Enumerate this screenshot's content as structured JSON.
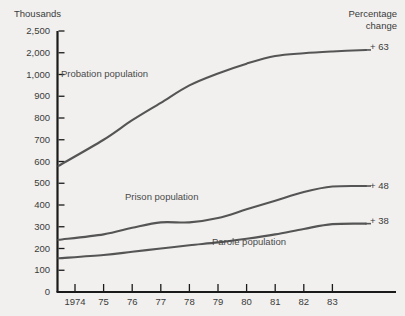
{
  "figure": {
    "unit_label": "Thousands",
    "corner_label_line1": "Percentage",
    "corner_label_line2": "change",
    "background_color": "#f1f0ee",
    "line_color": "#555555",
    "axis_color": "#1a1a1a",
    "text_color": "#3b3b3b"
  },
  "chart_data": {
    "type": "line",
    "title": "",
    "subtitle": "",
    "xlabel": "",
    "ylabel": "Thousands",
    "grid": false,
    "legend_position": "inline-annotations",
    "axis_note": "Y axis is non-linear: ticks are evenly spaced at 0,100,...,1000 then 2000, 2500",
    "x": [
      "1974",
      "75",
      "76",
      "77",
      "78",
      "79",
      "80",
      "81",
      "82",
      "83"
    ],
    "xtick_labels": [
      "1974",
      "75",
      "76",
      "77",
      "78",
      "79",
      "80",
      "81",
      "82",
      "83"
    ],
    "ytick_labels": [
      "0",
      "100",
      "200",
      "300",
      "400",
      "500",
      "600",
      "700",
      "800",
      "900",
      "1,000",
      "2,000",
      "2,500"
    ],
    "ytick_values": [
      0,
      100,
      200,
      300,
      400,
      500,
      600,
      700,
      800,
      900,
      1000,
      2000,
      2500
    ],
    "ylim": [
      0,
      2500
    ],
    "series": [
      {
        "name": "Probation population",
        "label": "Probation population",
        "end_label": "+ 63",
        "values": [
          580,
          700,
          790,
          870,
          950,
          1050,
          1500,
          1850,
          1980,
          2030
        ]
      },
      {
        "name": "Prison population",
        "label": "Prison population",
        "end_label": "+ 48",
        "values": [
          240,
          265,
          295,
          320,
          320,
          340,
          380,
          420,
          460,
          485
        ]
      },
      {
        "name": "Parole population",
        "label": "Parole population",
        "end_label": "+ 38",
        "values": [
          155,
          170,
          185,
          200,
          215,
          228,
          245,
          265,
          290,
          312
        ]
      }
    ]
  }
}
